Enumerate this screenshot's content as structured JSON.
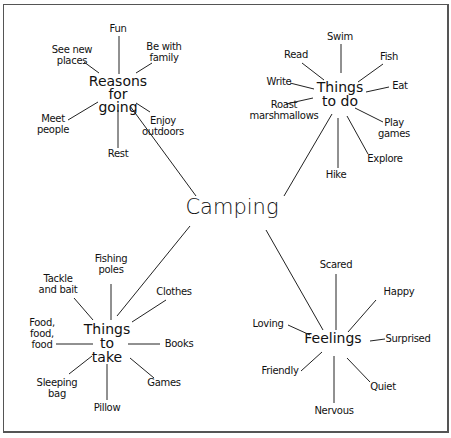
{
  "center": {
    "label": "Camping"
  },
  "hubs": [
    {
      "id": "reasons",
      "label_lines": [
        "Reasons",
        "for",
        "going"
      ],
      "leaves": [
        {
          "lines": [
            "Fun"
          ]
        },
        {
          "lines": [
            "See new",
            "places"
          ]
        },
        {
          "lines": [
            "Be with",
            "family"
          ]
        },
        {
          "lines": [
            "Meet",
            "people"
          ]
        },
        {
          "lines": [
            "Enjoy",
            "outdoors"
          ]
        },
        {
          "lines": [
            "Rest"
          ]
        }
      ]
    },
    {
      "id": "things-to-do",
      "label_lines": [
        "Things",
        "to do"
      ],
      "leaves": [
        {
          "lines": [
            "Swim"
          ]
        },
        {
          "lines": [
            "Read"
          ]
        },
        {
          "lines": [
            "Fish"
          ]
        },
        {
          "lines": [
            "Write"
          ]
        },
        {
          "lines": [
            "Eat"
          ]
        },
        {
          "lines": [
            "Roast",
            "marshmallows"
          ]
        },
        {
          "lines": [
            "Play",
            "games"
          ]
        },
        {
          "lines": [
            "Explore"
          ]
        },
        {
          "lines": [
            "Hike"
          ]
        }
      ]
    },
    {
      "id": "things-to-take",
      "label_lines": [
        "Things",
        "to",
        "take"
      ],
      "leaves": [
        {
          "lines": [
            "Fishing",
            "poles"
          ]
        },
        {
          "lines": [
            "Tackle",
            "and bait"
          ]
        },
        {
          "lines": [
            "Clothes"
          ]
        },
        {
          "lines": [
            "Food,",
            "food,",
            "food"
          ]
        },
        {
          "lines": [
            "Books"
          ]
        },
        {
          "lines": [
            "Sleeping",
            "bag"
          ]
        },
        {
          "lines": [
            "Games"
          ]
        },
        {
          "lines": [
            "Pillow"
          ]
        }
      ]
    },
    {
      "id": "feelings",
      "label_lines": [
        "Feelings"
      ],
      "leaves": [
        {
          "lines": [
            "Scared"
          ]
        },
        {
          "lines": [
            "Happy"
          ]
        },
        {
          "lines": [
            "Loving"
          ]
        },
        {
          "lines": [
            "Surprised"
          ]
        },
        {
          "lines": [
            "Friendly"
          ]
        },
        {
          "lines": [
            "Quiet"
          ]
        },
        {
          "lines": [
            "Nervous"
          ]
        }
      ]
    }
  ]
}
